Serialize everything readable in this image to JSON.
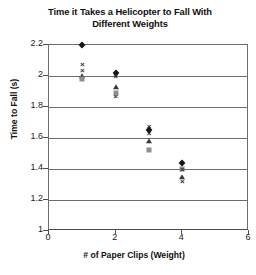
{
  "chart_data": {
    "type": "scatter",
    "title": "Time it Takes a Helicopter to Fall With Different Weights",
    "title_lines": [
      "Time it Takes a Helicopter to Fall With",
      "Different Weights"
    ],
    "xlabel": "# of Paper Clips (Weight)",
    "ylabel": "Time to Fall (s)",
    "xlim": [
      0,
      6
    ],
    "ylim": [
      1,
      2.2
    ],
    "xticks": [
      0,
      2,
      4,
      6
    ],
    "xtick_labels": [
      "0",
      "2",
      "4",
      "6"
    ],
    "yticks": [
      1,
      1.2,
      1.4,
      1.6,
      1.8,
      2,
      2.2
    ],
    "ytick_labels": [
      "1",
      "1.2",
      "1.4",
      "1.6",
      "1.8",
      "2",
      "2.2"
    ],
    "grid": "horizontal",
    "legend": "none",
    "x": [
      1,
      2,
      3,
      4
    ],
    "series": [
      {
        "name": "Trial 1",
        "marker": "diamond",
        "color": "#161616",
        "values": [
          2.2,
          2.02,
          1.65,
          1.44
        ]
      },
      {
        "name": "Trial 2",
        "marker": "square",
        "color": "#8e8e8e",
        "values": [
          1.98,
          1.89,
          1.52,
          1.4
        ]
      },
      {
        "name": "Trial 3",
        "marker": "triangle",
        "color": "#3a3a3a",
        "values": [
          2.0,
          1.93,
          1.58,
          1.35
        ]
      },
      {
        "name": "Trial 4",
        "marker": "cross",
        "color": "#2b2b2b",
        "values": [
          2.08,
          2.0,
          1.68,
          1.4
        ]
      },
      {
        "name": "Trial 5",
        "marker": "cross",
        "color": "#2b2b2b",
        "values": [
          2.04,
          1.87,
          1.63,
          1.32
        ]
      }
    ],
    "points": [
      {
        "x": 1,
        "y": 2.2,
        "marker": "diamond"
      },
      {
        "x": 1,
        "y": 2.08,
        "marker": "cross"
      },
      {
        "x": 1,
        "y": 2.04,
        "marker": "cross"
      },
      {
        "x": 1,
        "y": 2.0,
        "marker": "triangle"
      },
      {
        "x": 1,
        "y": 1.98,
        "marker": "square"
      },
      {
        "x": 2,
        "y": 2.02,
        "marker": "diamond"
      },
      {
        "x": 2,
        "y": 2.0,
        "marker": "cross"
      },
      {
        "x": 2,
        "y": 1.93,
        "marker": "triangle"
      },
      {
        "x": 2,
        "y": 1.89,
        "marker": "square"
      },
      {
        "x": 2,
        "y": 1.87,
        "marker": "cross"
      },
      {
        "x": 3,
        "y": 1.68,
        "marker": "cross"
      },
      {
        "x": 3,
        "y": 1.65,
        "marker": "diamond"
      },
      {
        "x": 3,
        "y": 1.63,
        "marker": "cross"
      },
      {
        "x": 3,
        "y": 1.58,
        "marker": "triangle"
      },
      {
        "x": 3,
        "y": 1.52,
        "marker": "square"
      },
      {
        "x": 4,
        "y": 1.44,
        "marker": "diamond"
      },
      {
        "x": 4,
        "y": 1.4,
        "marker": "square"
      },
      {
        "x": 4,
        "y": 1.4,
        "marker": "cross"
      },
      {
        "x": 4,
        "y": 1.35,
        "marker": "triangle"
      },
      {
        "x": 4,
        "y": 1.32,
        "marker": "cross"
      }
    ]
  },
  "style": {
    "axis_color": "#4d4d4d",
    "grid_color": "#6d6d6d",
    "text_color": "#1a1a1a",
    "background": "#ffffff"
  }
}
